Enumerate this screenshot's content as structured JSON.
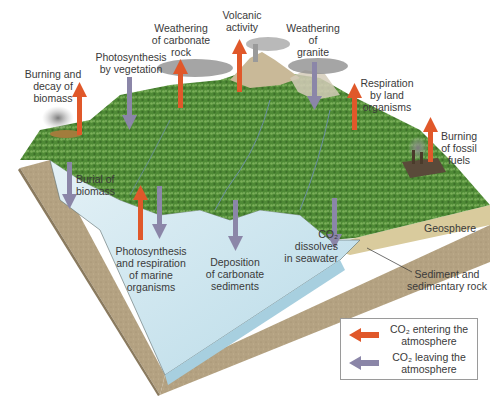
{
  "diagram": {
    "colors": {
      "entering_arrow": "#e0582a",
      "leaving_arrow": "#8b86a8",
      "land": "#5f8f3e",
      "water": "#cfe6ef",
      "rock": "#b7a486",
      "sediment": "#d8c99a",
      "cloud": "#8c8c8c"
    },
    "processes": [
      {
        "id": "burning-decay-biomass",
        "label": "Burning and\ndecay of\nbiomass",
        "direction": "entering"
      },
      {
        "id": "photosynthesis-vegetation",
        "label": "Photosynthesis\nby vegetation",
        "direction": "leaving"
      },
      {
        "id": "weathering-carbonate-rock",
        "label": "Weathering\nof carbonate\nrock",
        "direction": "entering"
      },
      {
        "id": "volcanic-activity",
        "label": "Volcanic\nactivity",
        "direction": "entering"
      },
      {
        "id": "weathering-granite",
        "label": "Weathering\nof\ngranite",
        "direction": "leaving"
      },
      {
        "id": "respiration-land",
        "label": "Respiration\nby land\norganisms",
        "direction": "entering"
      },
      {
        "id": "burning-fossil-fuels",
        "label": "Burning\nof fossil\nfuels",
        "direction": "entering"
      },
      {
        "id": "burial-biomass",
        "label": "Burial of\nbiomass",
        "direction": "leaving"
      },
      {
        "id": "marine-photosynthesis-respiration",
        "label": "Photosynthesis\nand respiration\nof marine\norganisms",
        "direction": "both"
      },
      {
        "id": "deposition-carbonate",
        "label": "Deposition\nof carbonate\nsediments",
        "direction": "leaving"
      },
      {
        "id": "co2-dissolves",
        "label": "CO₂\ndissolves\nin seawater",
        "direction": "leaving"
      }
    ],
    "layers": {
      "geosphere": "Geosphere",
      "sediment": "Sediment and\nsedimentary rock"
    },
    "legend": {
      "entering": "CO₂ entering the\natmosphere",
      "leaving": "CO₂ leaving the\natmosphere"
    }
  }
}
